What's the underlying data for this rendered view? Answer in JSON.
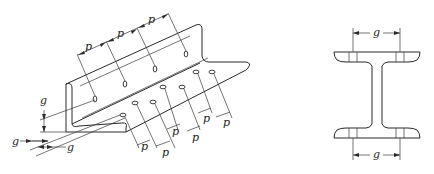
{
  "figure": {
    "type": "engineering-drawing",
    "left_view": {
      "name": "angle-section-bolt-layout",
      "pitch_label": "p",
      "gauge_label": "g",
      "top_pitch_labels": [
        "p",
        "p",
        "p"
      ],
      "bottom_pitch_labels": [
        "p",
        "p",
        "p",
        "p",
        "p",
        "p"
      ],
      "gauge_labels": [
        "g",
        "g",
        "g"
      ]
    },
    "right_view": {
      "name": "i-beam-cross-section",
      "top_gauge_label": "g",
      "bottom_gauge_label": "g"
    },
    "colors": {
      "line": "#2a2a2a",
      "background": "#ffffff"
    }
  }
}
